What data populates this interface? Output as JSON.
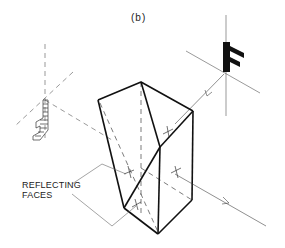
{
  "figure": {
    "title": "(b)",
    "annotation": {
      "line1": "REFLECTING",
      "line2": "FACES"
    },
    "object_letter": "F",
    "colors": {
      "line": "#111111",
      "thin_line": "#555555",
      "background": "#ffffff"
    }
  }
}
